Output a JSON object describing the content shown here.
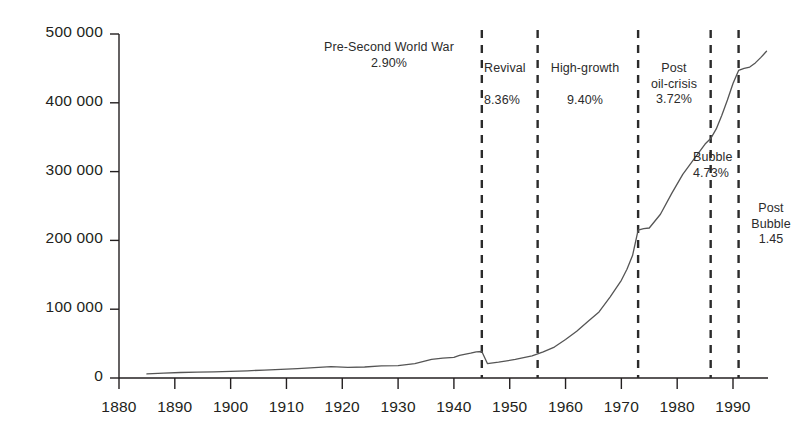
{
  "chart_data": {
    "type": "line",
    "title": "",
    "subtitle": "",
    "xlabel": "",
    "ylabel": "",
    "xlim": [
      1880,
      1996
    ],
    "ylim": [
      0,
      500000
    ],
    "grid": false,
    "legend": "none",
    "x_ticks": [
      "1880",
      "1890",
      "1900",
      "1910",
      "1920",
      "1930",
      "1940",
      "1950",
      "1960",
      "1970",
      "1980",
      "1990"
    ],
    "x_tick_values": [
      1880,
      1890,
      1900,
      1910,
      1920,
      1930,
      1940,
      1950,
      1960,
      1970,
      1980,
      1990
    ],
    "y_ticks": [
      "0",
      "100 000",
      "200 000",
      "300 000",
      "400 000",
      "500 000"
    ],
    "y_tick_values": [
      0,
      100000,
      200000,
      300000,
      400000,
      500000
    ],
    "series": [
      {
        "name": "series-1",
        "color": "#555555",
        "x": [
          1885,
          1888,
          1891,
          1894,
          1897,
          1900,
          1903,
          1906,
          1909,
          1912,
          1915,
          1918,
          1921,
          1924,
          1927,
          1930,
          1933,
          1936,
          1938,
          1940,
          1941,
          1943,
          1944,
          1945,
          1946,
          1948,
          1951,
          1954,
          1956,
          1958,
          1960,
          1962,
          1964,
          1966,
          1968,
          1970,
          1971,
          1972,
          1973,
          1974,
          1975,
          1977,
          1979,
          1981,
          1983,
          1985,
          1986,
          1987,
          1988,
          1989,
          1990,
          1991,
          1992,
          1993,
          1994,
          1995,
          1996
        ],
        "values": [
          6000,
          7000,
          8000,
          8500,
          9000,
          9500,
          10500,
          11500,
          12500,
          13500,
          15000,
          16500,
          15500,
          16000,
          17500,
          18000,
          21000,
          27000,
          29000,
          30000,
          33000,
          36000,
          38000,
          38500,
          21000,
          23000,
          27000,
          32000,
          38000,
          45000,
          56000,
          68000,
          82000,
          96000,
          118000,
          142000,
          158000,
          178000,
          215000,
          217000,
          218000,
          238000,
          268000,
          296000,
          318000,
          340000,
          348000,
          362000,
          382000,
          404000,
          428000,
          447000,
          450000,
          452000,
          458000,
          466000,
          475000
        ]
      }
    ],
    "annotations": [
      {
        "id": "pre-second-world-war",
        "label": "Pre-Second World War",
        "value": "2.90%",
        "align": "center"
      },
      {
        "id": "revival",
        "label": "Revival",
        "value": "8.36%",
        "align": "left"
      },
      {
        "id": "high-growth",
        "label": "High-growth",
        "value": "9.40%",
        "align": "center"
      },
      {
        "id": "post-oil-crisis",
        "label_line1": "Post",
        "label_line2": "oil-crisis",
        "value": "3.72%",
        "align": "center"
      },
      {
        "id": "bubble",
        "label": "Bubble",
        "value": "4.73%",
        "align": "left"
      },
      {
        "id": "post-bubble",
        "label_line1": "Post",
        "label_line2": "Bubble",
        "value": "1.45",
        "align": "center"
      }
    ],
    "period_dividers": [
      {
        "id": "divider-1945",
        "year": 1945
      },
      {
        "id": "divider-1955",
        "year": 1955
      },
      {
        "id": "divider-1973",
        "year": 1973
      },
      {
        "id": "divider-1986",
        "year": 1986
      },
      {
        "id": "divider-1991",
        "year": 1991
      }
    ],
    "colors": {
      "line": "#555555",
      "axis": "#231f20",
      "divider": "#2b2b2b",
      "text": "#231f20",
      "background": "#ffffff"
    }
  }
}
